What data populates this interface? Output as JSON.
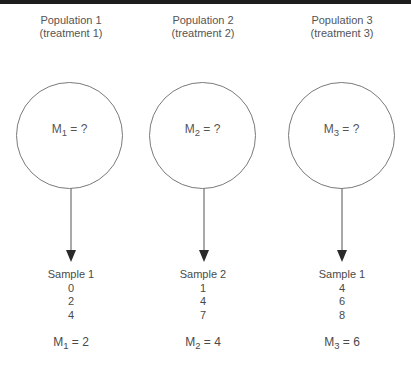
{
  "colors": {
    "top_bar": "#1e1e1e",
    "circle_stroke": "#7a7a7a",
    "arrow": "#7a7a7a",
    "arrowhead": "#2a2a2a",
    "text": "#4a4a4a"
  },
  "columns": [
    {
      "population_label": "Population 1",
      "treatment_label": "(treatment 1)",
      "circle": {
        "symbol": "M",
        "subscript": "1",
        "value_text": " = ?"
      },
      "sample": {
        "title": "Sample 1",
        "values": [
          "0",
          "2",
          "4"
        ],
        "mean": {
          "symbol": "M",
          "subscript": "1",
          "value_text": " = 2"
        }
      }
    },
    {
      "population_label": "Population 2",
      "treatment_label": "(treatment 2)",
      "circle": {
        "symbol": "M",
        "subscript": "2",
        "value_text": " = ?"
      },
      "sample": {
        "title": "Sample 2",
        "values": [
          "1",
          "4",
          "7"
        ],
        "mean": {
          "symbol": "M",
          "subscript": "2",
          "value_text": " = 4"
        }
      }
    },
    {
      "population_label": "Population 3",
      "treatment_label": "(treatment 3)",
      "circle": {
        "symbol": "M",
        "subscript": "3",
        "value_text": " = ?"
      },
      "sample": {
        "title": "Sample 1",
        "values": [
          "4",
          "6",
          "8"
        ],
        "mean": {
          "symbol": "M",
          "subscript": "3",
          "value_text": " = 6"
        }
      }
    }
  ]
}
